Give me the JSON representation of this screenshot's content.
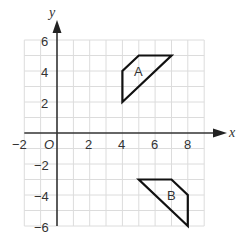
{
  "diagram": {
    "type": "coordinate-grid",
    "x_axis": {
      "label": "x",
      "min": -2,
      "max": 9,
      "ticks": [
        -2,
        2,
        4,
        6,
        8
      ]
    },
    "y_axis": {
      "label": "y",
      "min": -6,
      "max": 6,
      "ticks": [
        6,
        4,
        2,
        -2,
        -4,
        -6
      ]
    },
    "origin_label": "O",
    "shapes": [
      {
        "label": "A",
        "vertices": [
          [
            4,
            2
          ],
          [
            4,
            4
          ],
          [
            5,
            5
          ],
          [
            7,
            5
          ]
        ]
      },
      {
        "label": "B",
        "vertices": [
          [
            5,
            -3
          ],
          [
            7,
            -3
          ],
          [
            8,
            -4
          ],
          [
            8,
            -6
          ]
        ]
      }
    ],
    "colors": {
      "grid": "#d9d9d9",
      "axis": "#333333",
      "shape": "#111111"
    }
  },
  "labels": {
    "x_axis": "x",
    "y_axis": "y",
    "origin": "O",
    "x_ticks": [
      "−2",
      "2",
      "4",
      "6",
      "8"
    ],
    "y_ticks": [
      "6",
      "4",
      "2",
      "−2",
      "−4",
      "−6"
    ],
    "shape_a": "A",
    "shape_b": "B"
  }
}
